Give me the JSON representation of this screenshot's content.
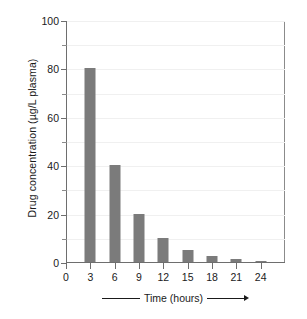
{
  "chart_data": {
    "type": "bar",
    "title": "",
    "xlabel": "Time (hours)",
    "ylabel": "Drug concentration (µg/L plasma)",
    "categories": [
      "3",
      "6",
      "9",
      "12",
      "15",
      "18",
      "21",
      "24"
    ],
    "values": [
      80,
      40,
      20,
      10,
      5,
      2.5,
      1.3,
      0.6
    ],
    "x": [
      3,
      6,
      9,
      12,
      15,
      18,
      21,
      24
    ],
    "xlim": [
      0,
      27
    ],
    "ylim": [
      0,
      100
    ],
    "x_tick_labels": [
      "0",
      "3",
      "6",
      "9",
      "12",
      "15",
      "18",
      "21",
      "24"
    ],
    "x_tick_values": [
      0,
      3,
      6,
      9,
      12,
      15,
      18,
      21,
      24
    ],
    "y_tick_labels": [
      "0",
      "20",
      "40",
      "60",
      "80",
      "100"
    ],
    "y_tick_values": [
      0,
      20,
      40,
      60,
      80,
      100
    ],
    "y_minor_ticks": [
      10,
      30,
      50,
      70,
      90
    ],
    "grid": "horizontal",
    "grid_values": [
      10,
      20,
      30,
      40,
      50,
      60,
      70,
      80,
      90,
      100
    ],
    "legend": null,
    "bar_color": "#7b7b7b",
    "grid_color": "#f0f0f0",
    "axis_color": "#6e6e6e",
    "background_color": "#ffffff",
    "series": [
      {
        "name": "Drug concentration",
        "values": [
          80,
          40,
          20,
          10,
          5,
          2.5,
          1.3,
          0.6
        ]
      }
    ]
  },
  "axis_caption": {
    "text": "Time (hours)",
    "leading_rule": "",
    "trailing_rule": "",
    "arrow": "▶"
  }
}
